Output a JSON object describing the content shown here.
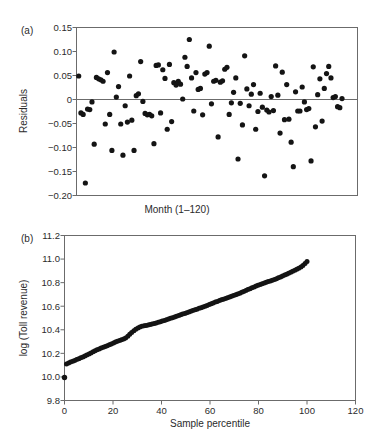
{
  "figure": {
    "background_color": "#ffffff",
    "ink_color": "#141414",
    "axis_color": "#6b6b6b"
  },
  "panels": [
    {
      "id": "panel-a",
      "label": "(a)",
      "chart_ref": 0
    },
    {
      "id": "panel-b",
      "label": "(b)",
      "chart_ref": 1
    }
  ],
  "chart_data": [
    {
      "type": "scatter",
      "panel": "(a)",
      "title": "",
      "xlabel": "Month (1–120)",
      "ylabel": "Residuals",
      "xlim": [
        0,
        127
      ],
      "ylim": [
        -0.2,
        0.15
      ],
      "xticks": [],
      "xticklabels": [],
      "yticks": [
        0.15,
        0.1,
        0.05,
        0,
        -0.05,
        -0.1,
        -0.15,
        -0.2
      ],
      "yticklabels": [
        "0.15",
        "0.10",
        "0.05",
        "0",
        "−0.05",
        "−0.10",
        "−0.15",
        "−0.20"
      ],
      "grid": false,
      "reference_lines": [
        {
          "axis": "y",
          "value": 0
        }
      ],
      "marker": "filled-circle",
      "n_points": 120,
      "x": [
        1,
        2,
        3,
        4,
        5,
        6,
        7,
        8,
        9,
        10,
        11,
        12,
        13,
        14,
        15,
        16,
        17,
        18,
        19,
        20,
        21,
        22,
        23,
        24,
        25,
        26,
        27,
        28,
        29,
        30,
        31,
        32,
        33,
        34,
        35,
        36,
        37,
        38,
        39,
        40,
        41,
        42,
        43,
        44,
        45,
        46,
        47,
        48,
        49,
        50,
        51,
        52,
        53,
        54,
        55,
        56,
        57,
        58,
        59,
        60,
        61,
        62,
        63,
        64,
        65,
        66,
        67,
        68,
        69,
        70,
        71,
        72,
        73,
        74,
        75,
        76,
        77,
        78,
        79,
        80,
        81,
        82,
        83,
        84,
        85,
        86,
        87,
        88,
        89,
        90,
        91,
        92,
        93,
        94,
        95,
        96,
        97,
        98,
        99,
        100,
        101,
        102,
        103,
        104,
        105,
        106,
        107,
        108,
        109,
        110,
        111,
        112,
        113,
        114,
        115,
        116,
        117,
        118,
        119,
        120
      ],
      "y": [
        0.049,
        -0.028,
        -0.031,
        -0.174,
        -0.02,
        -0.021,
        -0.005,
        -0.093,
        0.046,
        0.043,
        0.041,
        0.038,
        -0.051,
        0.056,
        -0.031,
        -0.106,
        0.099,
        0.005,
        0.027,
        -0.051,
        -0.116,
        -0.013,
        -0.047,
        0.049,
        -0.043,
        -0.106,
        0.008,
        0.012,
        0.079,
        -0.004,
        -0.029,
        -0.032,
        -0.031,
        -0.034,
        -0.092,
        0.071,
        0.072,
        -0.028,
        0.062,
        0.044,
        -0.062,
        0.073,
        -0.046,
        0.035,
        0.03,
        0.038,
        0.032,
        0.001,
        0.088,
        0.069,
        0.125,
        0.045,
        -0.024,
        0.056,
        0.021,
        0.023,
        -0.032,
        0.053,
        0.056,
        0.111,
        -0.009,
        0.038,
        0.04,
        -0.078,
        0.036,
        0.039,
        0.063,
        0.067,
        -0.031,
        -0.007,
        0.015,
        0.045,
        -0.124,
        -0.008,
        -0.053,
        0.091,
        0.022,
        -0.013,
        0.011,
        0.031,
        -0.062,
        -0.025,
        0.013,
        -0.016,
        -0.159,
        -0.022,
        -0.026,
        0.006,
        -0.023,
        0.07,
        0.009,
        -0.07,
        0.057,
        -0.042,
        0.031,
        -0.041,
        -0.089,
        -0.14,
        0.016,
        -0.024,
        -0.024,
        0.026,
        -0.005,
        -0.021,
        -0.019,
        -0.128,
        0.068,
        -0.057,
        0.01,
        0.043,
        -0.045,
        0.023,
        0.054,
        0.069,
        0.045,
        0.004,
        0.006,
        -0.015,
        -0.017,
        0.002
      ]
    },
    {
      "type": "scatter",
      "panel": "(b)",
      "title": "",
      "xlabel": "Sample percentile",
      "ylabel": "log (Toll revenue)",
      "xlim": [
        0,
        120
      ],
      "ylim": [
        9.8,
        11.2
      ],
      "xticks": [
        0,
        20,
        40,
        60,
        80,
        100,
        120
      ],
      "xticklabels": [
        "0",
        "20",
        "40",
        "60",
        "80",
        "100",
        "120"
      ],
      "yticks": [
        11.2,
        11.0,
        10.8,
        10.6,
        10.4,
        10.2,
        10.0,
        9.8
      ],
      "yticklabels": [
        "11.2",
        "11.0",
        "10.8",
        "10.6",
        "10.4",
        "10.2",
        "10.0",
        "9.8"
      ],
      "grid": false,
      "marker": "filled-circle",
      "n_points": 120,
      "note": "Monotone increasing empirical quantile plot; one isolated low outlier at percentile 0.",
      "x": [
        0.0,
        0.8,
        1.7,
        2.5,
        3.4,
        4.2,
        5.0,
        5.9,
        6.7,
        7.6,
        8.4,
        9.2,
        10.1,
        10.9,
        11.8,
        12.6,
        13.4,
        14.3,
        15.1,
        16.0,
        16.8,
        17.6,
        18.5,
        19.3,
        20.2,
        21.0,
        21.8,
        22.7,
        23.5,
        24.4,
        25.2,
        26.1,
        26.9,
        27.7,
        28.6,
        29.4,
        30.3,
        31.1,
        31.9,
        32.8,
        33.6,
        34.5,
        35.3,
        36.1,
        37.0,
        37.8,
        38.7,
        39.5,
        40.3,
        41.2,
        42.0,
        42.9,
        43.7,
        44.5,
        45.4,
        46.2,
        47.1,
        47.9,
        48.7,
        49.6,
        50.4,
        51.3,
        52.1,
        52.9,
        53.8,
        54.6,
        55.5,
        56.3,
        57.1,
        58.0,
        58.8,
        59.7,
        60.5,
        61.3,
        62.2,
        63.0,
        63.9,
        64.7,
        65.5,
        66.4,
        67.2,
        68.1,
        68.9,
        69.7,
        70.6,
        71.4,
        72.3,
        73.1,
        73.9,
        74.8,
        75.6,
        76.5,
        77.3,
        78.2,
        79.0,
        79.8,
        80.7,
        81.5,
        82.4,
        83.2,
        84.0,
        84.9,
        85.7,
        86.6,
        87.4,
        88.2,
        89.1,
        89.9,
        90.8,
        91.6,
        92.4,
        93.3,
        94.1,
        95.0,
        95.8,
        96.6,
        97.5,
        98.3,
        99.2,
        100.0
      ],
      "y": [
        9.995,
        10.11,
        10.118,
        10.126,
        10.133,
        10.14,
        10.147,
        10.155,
        10.162,
        10.17,
        10.178,
        10.186,
        10.194,
        10.203,
        10.213,
        10.222,
        10.231,
        10.238,
        10.245,
        10.252,
        10.258,
        10.265,
        10.272,
        10.28,
        10.288,
        10.296,
        10.303,
        10.31,
        10.316,
        10.322,
        10.33,
        10.345,
        10.362,
        10.378,
        10.392,
        10.404,
        10.415,
        10.424,
        10.43,
        10.434,
        10.437,
        10.441,
        10.445,
        10.449,
        10.453,
        10.458,
        10.463,
        10.469,
        10.474,
        10.479,
        10.485,
        10.491,
        10.497,
        10.503,
        10.509,
        10.515,
        10.521,
        10.527,
        10.533,
        10.539,
        10.545,
        10.551,
        10.557,
        10.563,
        10.569,
        10.575,
        10.582,
        10.588,
        10.594,
        10.6,
        10.607,
        10.614,
        10.621,
        10.628,
        10.635,
        10.641,
        10.648,
        10.654,
        10.66,
        10.666,
        10.672,
        10.678,
        10.684,
        10.69,
        10.697,
        10.704,
        10.711,
        10.718,
        10.725,
        10.733,
        10.741,
        10.749,
        10.757,
        10.764,
        10.771,
        10.778,
        10.785,
        10.791,
        10.797,
        10.803,
        10.809,
        10.815,
        10.821,
        10.827,
        10.834,
        10.841,
        10.848,
        10.856,
        10.864,
        10.872,
        10.88,
        10.888,
        10.896,
        10.905,
        10.914,
        10.923,
        10.933,
        10.945,
        10.962,
        10.98
      ]
    }
  ]
}
